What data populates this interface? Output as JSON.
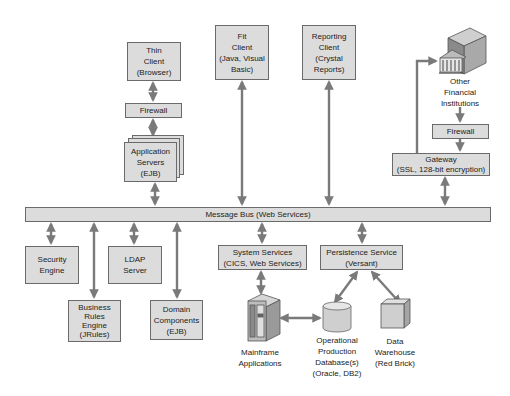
{
  "diagram": {
    "type": "system-architecture",
    "message_bus": {
      "label": "Message Bus (Web Services)"
    },
    "nodes": {
      "thin_client": {
        "lines": [
          "Thin",
          "Client",
          "(Browser)"
        ]
      },
      "firewall_left": {
        "lines": [
          "Firewall"
        ]
      },
      "app_servers": {
        "lines": [
          "Application",
          "Servers",
          "(EJB)"
        ]
      },
      "fit_client": {
        "lines": [
          "Fit",
          "Client",
          "(Java, Visual",
          "Basic)"
        ]
      },
      "reporting_client": {
        "lines": [
          "Reporting",
          "Client",
          "(Crystal",
          "Reports)"
        ]
      },
      "other_fi": {
        "lines": [
          "Other",
          "Financial",
          "Institutions"
        ],
        "icon": "bank-building-icon"
      },
      "firewall_right": {
        "lines": [
          "Firewall"
        ]
      },
      "gateway": {
        "lines": [
          "Gateway",
          "(SSL, 128-bit encryption)"
        ]
      },
      "security_engine": {
        "lines": [
          "Security",
          "Engine"
        ]
      },
      "ldap_server": {
        "lines": [
          "LDAP",
          "Server"
        ]
      },
      "business_rules": {
        "lines": [
          "Business",
          "Rules",
          "Engine",
          "(JRules)"
        ]
      },
      "domain_components": {
        "lines": [
          "Domain",
          "Components",
          "(EJB)"
        ]
      },
      "system_services": {
        "lines": [
          "System Services",
          "(CICS, Web Services)"
        ]
      },
      "persistence_service": {
        "lines": [
          "Persistence Service",
          "(Versant)"
        ]
      },
      "mainframe": {
        "lines": [
          "Mainframe",
          "Applications"
        ],
        "icon": "mainframe-server-icon"
      },
      "database": {
        "lines": [
          "Operational",
          "Production",
          "Database(s)",
          "(Oracle, DB2)"
        ],
        "icon": "database-cylinder-icon"
      },
      "data_warehouse": {
        "lines": [
          "Data",
          "Warehouse",
          "(Red Brick)"
        ],
        "icon": "data-cube-icon"
      }
    },
    "connections": [
      {
        "from": "Thin Client",
        "to": "Firewall",
        "type": "bidirectional"
      },
      {
        "from": "Firewall",
        "to": "Application Servers",
        "type": "bidirectional"
      },
      {
        "from": "Application Servers",
        "to": "Message Bus",
        "type": "bidirectional"
      },
      {
        "from": "Fit Client",
        "to": "Message Bus",
        "type": "bidirectional"
      },
      {
        "from": "Reporting Client",
        "to": "Message Bus",
        "type": "bidirectional"
      },
      {
        "from": "Gateway",
        "to": "Other Financial Institutions",
        "type": "directed"
      },
      {
        "from": "Other Financial Institutions",
        "to": "Firewall",
        "type": "directed"
      },
      {
        "from": "Firewall",
        "to": "Gateway",
        "type": "directed"
      },
      {
        "from": "Gateway",
        "to": "Message Bus",
        "type": "bidirectional"
      },
      {
        "from": "Message Bus",
        "to": "Security Engine",
        "type": "bidirectional"
      },
      {
        "from": "Message Bus",
        "to": "Business Rules Engine",
        "type": "bidirectional"
      },
      {
        "from": "Message Bus",
        "to": "LDAP Server",
        "type": "bidirectional"
      },
      {
        "from": "Message Bus",
        "to": "Domain Components",
        "type": "bidirectional"
      },
      {
        "from": "Message Bus",
        "to": "System Services",
        "type": "bidirectional"
      },
      {
        "from": "Message Bus",
        "to": "Persistence Service",
        "type": "bidirectional"
      },
      {
        "from": "System Services",
        "to": "Mainframe Applications",
        "type": "bidirectional"
      },
      {
        "from": "Mainframe Applications",
        "to": "Operational Production Database(s)",
        "type": "bidirectional"
      },
      {
        "from": "Persistence Service",
        "to": "Operational Production Database(s)",
        "type": "bidirectional"
      },
      {
        "from": "Persistence Service",
        "to": "Data Warehouse",
        "type": "bidirectional"
      }
    ],
    "colors": {
      "box_fill": "#dcdcdc",
      "border": "#6a6a6a",
      "arrow": "#7a7a7a"
    }
  }
}
